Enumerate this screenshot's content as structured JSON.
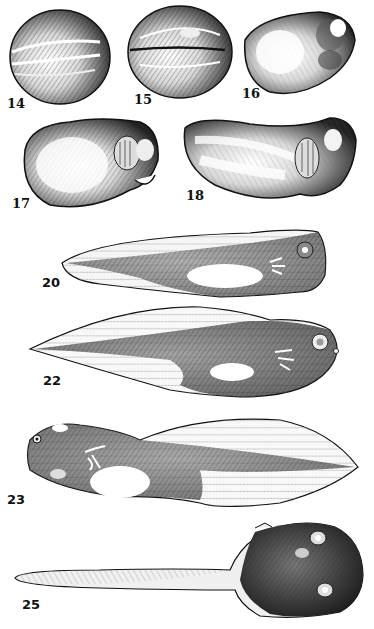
{
  "plate": {
    "subject": "Frog embryo and tadpole developmental stages",
    "figures": [
      {
        "stage": "14",
        "description": "neural plate stage embryo, dorsal view"
      },
      {
        "stage": "15",
        "description": "neural fold stage embryo"
      },
      {
        "stage": "16",
        "description": "tail bud embryo"
      },
      {
        "stage": "17",
        "description": "embryo with gill buds"
      },
      {
        "stage": "18",
        "description": "elongated embryo with gill plates"
      },
      {
        "stage": "20",
        "description": "hatching tadpole with external gills"
      },
      {
        "stage": "22",
        "description": "tadpole with tail fin and external gills"
      },
      {
        "stage": "23",
        "description": "tadpole with branched external gills"
      },
      {
        "stage": "25",
        "description": "tadpole, dorsal view"
      }
    ]
  },
  "colors": {
    "ink": "#111111",
    "paper": "#ffffff",
    "shade": "#555555",
    "light": "#bbbbbb"
  }
}
